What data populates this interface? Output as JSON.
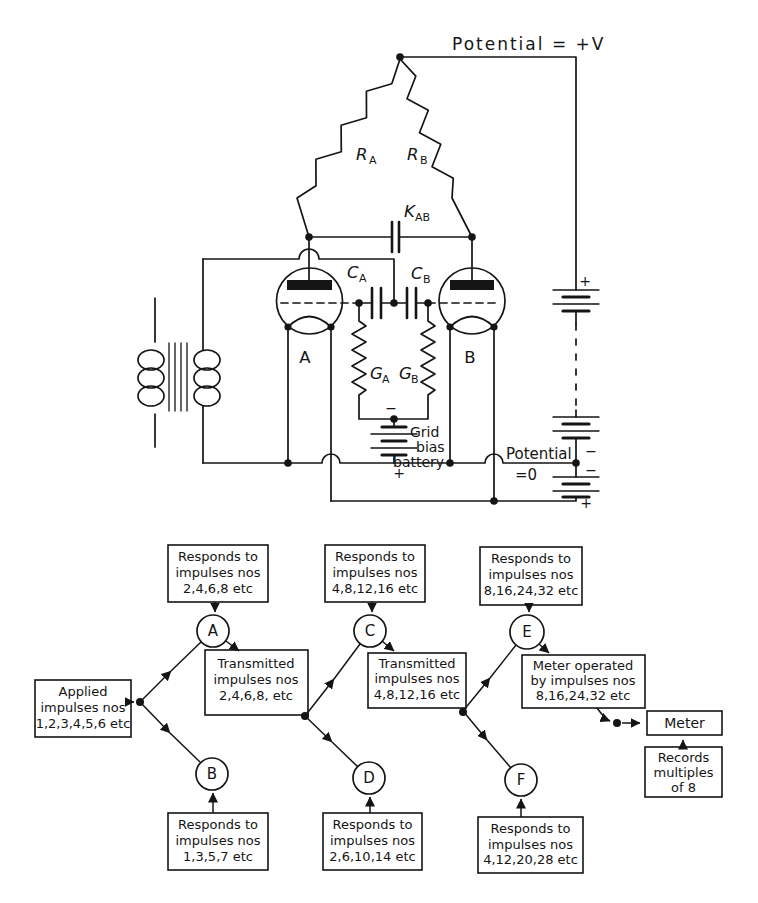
{
  "schematic": {
    "supply_label": "Potential = +V",
    "r_a": {
      "base": "R",
      "sub": "A"
    },
    "r_b": {
      "base": "R",
      "sub": "B"
    },
    "k_ab": {
      "base": "K",
      "sub": "AB"
    },
    "c_a": {
      "base": "C",
      "sub": "A"
    },
    "c_b": {
      "base": "C",
      "sub": "B"
    },
    "g_a": {
      "base": "G",
      "sub": "A"
    },
    "g_b": {
      "base": "G",
      "sub": "B"
    },
    "valve_a": "A",
    "valve_b": "B",
    "grid_bias": {
      "line1": "Grid",
      "line2": "bias",
      "line3": "battery"
    },
    "zero_potential": {
      "line1": "Potential",
      "line2": "=0"
    },
    "polarity": {
      "plus": "+",
      "minus": "−"
    }
  },
  "flow": {
    "circles": {
      "a": "A",
      "b": "B",
      "c": "C",
      "d": "D",
      "e": "E",
      "f": "F"
    },
    "applied": {
      "line1": "Applied",
      "line2": "impulses nos",
      "line3": "1,2,3,4,5,6 etc"
    },
    "top_a": {
      "line1": "Responds to",
      "line2": "impulses nos",
      "line3": "2,4,6,8 etc"
    },
    "top_c": {
      "line1": "Responds to",
      "line2": "impulses nos",
      "line3": "4,8,12,16 etc"
    },
    "top_e": {
      "line1": "Responds to",
      "line2": "impulses nos",
      "line3": "8,16,24,32 etc"
    },
    "trans_ab": {
      "line1": "Transmitted",
      "line2": "impulses nos",
      "line3": "2,4,6,8, etc"
    },
    "trans_cd": {
      "line1": "Transmitted",
      "line2": "impulses nos",
      "line3": "4,8,12,16 etc"
    },
    "meter_op": {
      "line1": "Meter operated",
      "line2": "by impulses nos",
      "line3": "8,16,24,32 etc"
    },
    "meter": "Meter",
    "records": {
      "line1": "Records",
      "line2": "multiples",
      "line3": "of 8"
    },
    "bottom_b": {
      "line1": "Responds to",
      "line2": "impulses nos",
      "line3": "1,3,5,7 etc"
    },
    "bottom_d": {
      "line1": "Responds to",
      "line2": "impulses nos",
      "line3": "2,6,10,14 etc"
    },
    "bottom_f": {
      "line1": "Responds to",
      "line2": "impulses nos",
      "line3": "4,12,20,28 etc"
    }
  }
}
